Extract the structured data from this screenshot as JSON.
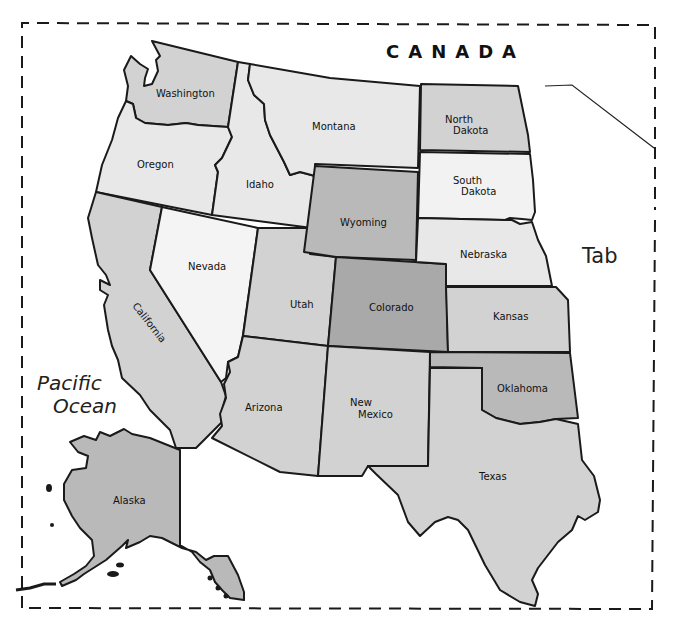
{
  "map": {
    "title_fragment": "",
    "country_label": "CANADA",
    "ocean_label_line1": "Pacific",
    "ocean_label_line2": "Ocean",
    "tab_label": "Tab",
    "colors": {
      "white": "#ffffff",
      "light": "#e8e8e8",
      "lighter": "#f2f2f2",
      "medium": "#d2d2d2",
      "dark": "#b9b9b9",
      "darker": "#a9a9a9",
      "border": "#1a1a1a"
    },
    "states": [
      {
        "name": "Washington",
        "shade": "medium"
      },
      {
        "name": "Oregon",
        "shade": "light"
      },
      {
        "name": "California",
        "shade": "medium"
      },
      {
        "name": "Idaho",
        "shade": "light"
      },
      {
        "name": "Nevada",
        "shade": "lighter"
      },
      {
        "name": "Montana",
        "shade": "light"
      },
      {
        "name": "Wyoming",
        "shade": "dark"
      },
      {
        "name": "Utah",
        "shade": "medium"
      },
      {
        "name": "Colorado",
        "shade": "darker"
      },
      {
        "name": "Arizona",
        "shade": "medium"
      },
      {
        "name": "New Mexico",
        "shade": "medium"
      },
      {
        "name": "North Dakota",
        "shade": "medium"
      },
      {
        "name": "South Dakota",
        "shade": "lighter"
      },
      {
        "name": "Nebraska",
        "shade": "light"
      },
      {
        "name": "Kansas",
        "shade": "medium"
      },
      {
        "name": "Oklahoma",
        "shade": "dark"
      },
      {
        "name": "Texas",
        "shade": "medium"
      },
      {
        "name": "Alaska",
        "shade": "dark"
      }
    ],
    "labels": {
      "washington": "Washington",
      "oregon": "Oregon",
      "california": "California",
      "idaho": "Idaho",
      "nevada": "Nevada",
      "montana": "Montana",
      "wyoming": "Wyoming",
      "utah": "Utah",
      "colorado": "Colorado",
      "arizona": "Arizona",
      "new_mexico_1": "New",
      "new_mexico_2": "Mexico",
      "north_dakota_1": "North",
      "north_dakota_2": "Dakota",
      "south_dakota_1": "South",
      "south_dakota_2": "Dakota",
      "nebraska": "Nebraska",
      "kansas": "Kansas",
      "oklahoma": "Oklahoma",
      "texas": "Texas",
      "alaska": "Alaska"
    }
  }
}
